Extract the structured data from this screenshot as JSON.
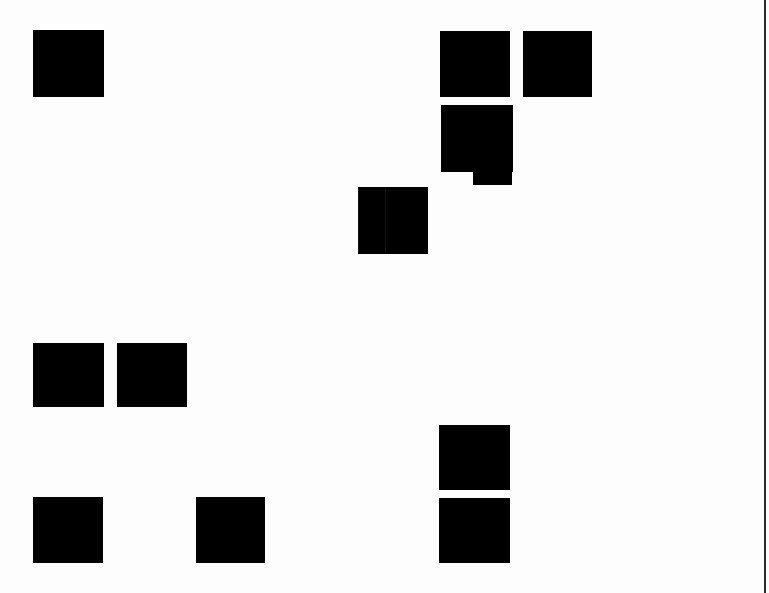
{
  "canvas": {
    "width": 769,
    "height": 593,
    "background_color": "#ffffff",
    "block_color": "#000000",
    "edge_rule_color": "#2b2b2b",
    "seam_color": "#141414"
  },
  "edge_rule": {
    "name": "right-edge-rule",
    "x": 764,
    "width": 2,
    "top": 0,
    "height": 593
  },
  "blocks": [
    {
      "id": "block-top-left",
      "label": "",
      "x": 33,
      "y": 30,
      "width": 71,
      "height": 67,
      "shape": "rect",
      "seam_x": null
    },
    {
      "id": "block-top-right-a",
      "label": "",
      "x": 440,
      "y": 31,
      "width": 70,
      "height": 66,
      "shape": "rect",
      "seam_x": null
    },
    {
      "id": "block-top-right-b",
      "label": "",
      "x": 523,
      "y": 31,
      "width": 69,
      "height": 66,
      "shape": "rect",
      "seam_x": null
    },
    {
      "id": "block-middle-pair",
      "label": "",
      "x": 358,
      "y": 187,
      "width": 70,
      "height": 67,
      "shape": "rect-seamed",
      "seam_x": 27
    },
    {
      "id": "block-mid-left-a",
      "label": "",
      "x": 33,
      "y": 343,
      "width": 71,
      "height": 64,
      "shape": "rect",
      "seam_x": null
    },
    {
      "id": "block-mid-left-b",
      "label": "",
      "x": 117,
      "y": 343,
      "width": 70,
      "height": 64,
      "shape": "rect",
      "seam_x": null
    },
    {
      "id": "block-lower-right-a",
      "label": "",
      "x": 439,
      "y": 425,
      "width": 71,
      "height": 65,
      "shape": "rect",
      "seam_x": null
    },
    {
      "id": "block-lower-right-b",
      "label": "",
      "x": 439,
      "y": 498,
      "width": 71,
      "height": 65,
      "shape": "rect",
      "seam_x": null
    },
    {
      "id": "block-bottom-left-a",
      "label": "",
      "x": 33,
      "y": 497,
      "width": 70,
      "height": 66,
      "shape": "rect",
      "seam_x": null
    },
    {
      "id": "block-bottom-left-b",
      "label": "",
      "x": 196,
      "y": 497,
      "width": 69,
      "height": 66,
      "shape": "rect",
      "seam_x": null
    }
  ],
  "notched_block": {
    "id": "block-notched",
    "label": "",
    "body": {
      "x": 441,
      "y": 105,
      "width": 72,
      "height": 67
    },
    "tab": {
      "x": 473,
      "y": 172,
      "width": 39,
      "height": 13
    }
  },
  "wash_regions": [
    {
      "id": "wash-upper-band",
      "x": 0,
      "y": 98,
      "width": 769,
      "height": 18
    },
    {
      "id": "wash-mid-band",
      "x": 0,
      "y": 318,
      "width": 769,
      "height": 14
    },
    {
      "id": "wash-lower-band",
      "x": 0,
      "y": 564,
      "width": 769,
      "height": 16
    },
    {
      "id": "wash-left-column",
      "x": 0,
      "y": 0,
      "width": 14,
      "height": 593
    }
  ]
}
